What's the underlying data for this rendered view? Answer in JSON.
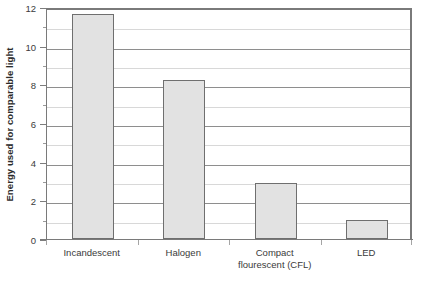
{
  "chart_data": {
    "type": "bar",
    "title": "",
    "xlabel": "",
    "ylabel": "Energy used for comparable light",
    "categories": [
      "Incandescent",
      "Halogen",
      "Compact\nflourescent (CFL)",
      "LED"
    ],
    "values": [
      11.65,
      8.25,
      2.9,
      1.0
    ],
    "ylim": [
      0,
      12
    ],
    "y_major_ticks": [
      0,
      2,
      4,
      6,
      8,
      10,
      12
    ],
    "y_major_tick_labels": [
      "0",
      "2",
      "4",
      "6",
      "8",
      "10",
      "12"
    ],
    "y_minor_ticks": [
      1,
      3,
      5,
      7,
      9,
      11
    ],
    "grid": "horizontal",
    "legend": "none",
    "bar_fill_color": "#e2e2e2",
    "bar_border_color": "#6f6f6f",
    "major_gridline_color": "#8e8e8e",
    "minor_gridline_color": "#d8d8d8",
    "axis_color": "#7a7a7a",
    "text_color": "#3a3a3a"
  },
  "watermark": {
    "text": ""
  }
}
